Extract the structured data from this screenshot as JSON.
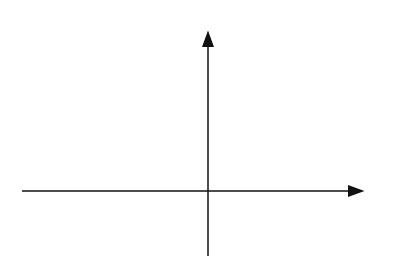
{
  "chart_data": {
    "type": "line",
    "title": "",
    "xlabel": "x",
    "ylabel": "y",
    "xlim": [
      -6,
      5
    ],
    "ylim": [
      -2,
      5
    ],
    "grid": true,
    "series": [
      {
        "name": "y = (x + 3)^2",
        "label_text": "y = (x + 3)",
        "label_sup": "2",
        "vertex": [
          -3,
          0
        ],
        "shift": -3,
        "color": "#333333"
      },
      {
        "name": "y = x^2",
        "label_text": "y = x",
        "label_sup": "2",
        "vertex": [
          0,
          0
        ],
        "shift": 0,
        "color": "#707070"
      },
      {
        "name": "y = (x - 2)^2",
        "label_text": "y = (x − 2)",
        "label_sup": "2",
        "vertex": [
          2,
          0
        ],
        "shift": 2,
        "color": "#2a2a2a"
      }
    ]
  },
  "axes": {
    "x_label": "x",
    "y_label": "y"
  },
  "labels": {
    "left_eq": "y = (x + 3)",
    "mid_eq": "y = x",
    "right_eq": "y = (x − 2)",
    "sup": "2"
  }
}
